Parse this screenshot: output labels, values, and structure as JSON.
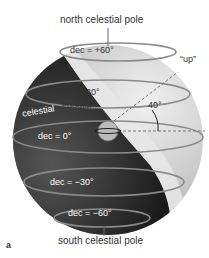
{
  "labels": {
    "north_pole": "north celestial pole",
    "south_pole": "south celestial pole",
    "up": "“up”",
    "angle": "40°",
    "equator_word1": "celestial",
    "equator_word2": "equator",
    "panel": "a"
  },
  "declinations": [
    {
      "label": "dec = +60°"
    },
    {
      "label": "dec = +30°"
    },
    {
      "label": "dec = 0°"
    },
    {
      "label": "dec = −30°"
    },
    {
      "label": "dec = −60°"
    }
  ],
  "colors": {
    "sphere_light": "#d8d8d8",
    "sphere_dark": "#2a2a2a",
    "circle_line": "#8a8a8a",
    "text_dark": "#333333",
    "text_light": "#ffffff"
  }
}
